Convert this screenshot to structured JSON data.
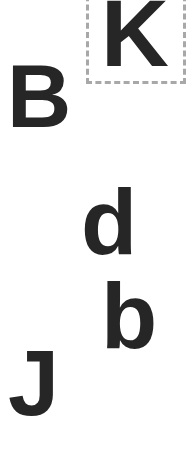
{
  "canvas": {
    "width": 188,
    "height": 458,
    "background": "#ffffff"
  },
  "selection_box": {
    "style": "dashed",
    "color": "#a8a8a8",
    "target_letter": "K"
  },
  "letters": [
    {
      "id": "K",
      "char": "K",
      "x": 104,
      "y": 0,
      "size": 92,
      "selected": true
    },
    {
      "id": "B",
      "char": "B",
      "x": 10,
      "y": 56,
      "size": 89,
      "selected": false
    },
    {
      "id": "d",
      "char": "d",
      "x": 83,
      "y": 186,
      "size": 92,
      "selected": false
    },
    {
      "id": "b",
      "char": "b",
      "x": 104,
      "y": 280,
      "size": 92,
      "selected": false
    },
    {
      "id": "J",
      "char": "J",
      "x": 10,
      "y": 342,
      "size": 92,
      "selected": false
    }
  ],
  "text_color": "#262626"
}
